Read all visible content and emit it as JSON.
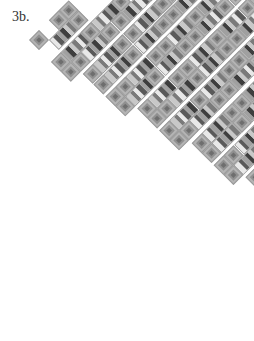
{
  "figure": {
    "label": "3b."
  },
  "style": {
    "colors": {
      "square_outer": "#b4b4b4",
      "square_middle": "#909090",
      "square_center": "#6e6e6e",
      "stripe_palette": [
        "#e8e8e8",
        "#5a5a5a",
        "#a0a0a0",
        "#3e3e3e",
        "#c8c8c8",
        "#7a7a7a"
      ],
      "gap": "#ffffff"
    }
  },
  "quilt": {
    "origin": [
      39,
      40
    ],
    "step": 10,
    "cell": 14,
    "band_gap": 3,
    "bands": [
      {
        "offset": 0,
        "top": "S.SS..........",
        "bottom": ".XXS.........."
      },
      {
        "offset": 0,
        "top": "SXXSXXS.S.....",
        "bottom": "SSXXSSXXSS...."
      },
      {
        "offset": 1,
        "top": "SXXSSXXSXXS...",
        "bottom": "SXXSXXSSXXS..."
      },
      {
        "offset": 1,
        "top": "SSXXSSXXSXXS..",
        "bottom": "SXXSXXSSXXSS.."
      },
      {
        "offset": 2,
        "top": "SXXSSXXSXXSS..",
        "bottom": "SSXXSXXSSXXS.."
      },
      {
        "offset": 2,
        "top": "SXXSXXSSXXSXXS",
        "bottom": "SSXXSSXXSXXSS."
      },
      {
        "offset": 3,
        "top": "SXXSSXXSXXSS..",
        "bottom": "SXXSXXSSXXSS.."
      },
      {
        "offset": 3,
        "top": "SSXXSXXSSXXS..",
        "bottom": "SXXSSXXSXXS..."
      },
      {
        "offset": 4,
        "top": "SXXSSXXSXS....",
        "bottom": "SSXXSS..S....."
      }
    ]
  }
}
